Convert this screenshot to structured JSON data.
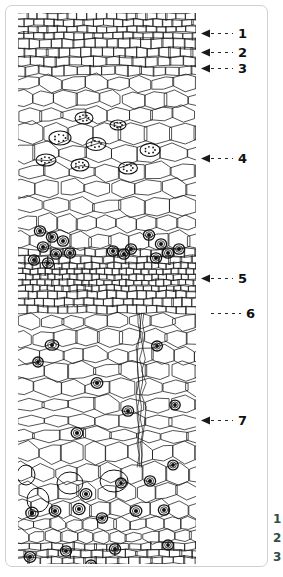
{
  "figure": {
    "type": "scientific-illustration",
    "style": "black ink line drawing on white",
    "frame_color": "#c9d4d2",
    "ink_color": "#1a1a1a",
    "background_color": "#ffffff"
  },
  "callouts": [
    {
      "number": "1",
      "y": 33,
      "arrow": true,
      "dash_len": 22,
      "label_x": 256
    },
    {
      "number": "2",
      "y": 52,
      "arrow": true,
      "dash_len": 22,
      "label_x": 256
    },
    {
      "number": "3",
      "y": 68,
      "arrow": true,
      "dash_len": 22,
      "label_x": 256
    },
    {
      "number": "4",
      "y": 158,
      "arrow": true,
      "dash_len": 22,
      "label_x": 256
    },
    {
      "number": "5",
      "y": 278,
      "arrow": true,
      "dash_len": 22,
      "label_x": 256
    },
    {
      "number": "6",
      "y": 313,
      "arrow": false,
      "dash_len": 30,
      "label_x": 256
    },
    {
      "number": "7",
      "y": 420,
      "arrow": true,
      "dash_len": 22,
      "label_x": 256
    }
  ],
  "edge_legend": {
    "visible_fragment": true,
    "items": [
      "1",
      "2",
      "3"
    ]
  },
  "tissue_bands": [
    {
      "name": "outer-brick-cell-layer",
      "top": 0,
      "height": 62,
      "cell": "small-rectangular"
    },
    {
      "name": "upper-polygonal-cortex",
      "top": 62,
      "height": 140,
      "cell": "large-polygonal"
    },
    {
      "name": "sclereid-cluster-band",
      "top": 202,
      "height": 90,
      "cell": "dark-nucleus-clusters"
    },
    {
      "name": "dense-small-cell-band",
      "top": 250,
      "height": 55,
      "cell": "fine-granular"
    },
    {
      "name": "mid-polygonal-cortex",
      "top": 300,
      "height": 130,
      "cell": "elongated-polygonal"
    },
    {
      "name": "lower-parenchyma",
      "top": 420,
      "height": 131,
      "cell": "rounded-with-dark-specks"
    }
  ]
}
